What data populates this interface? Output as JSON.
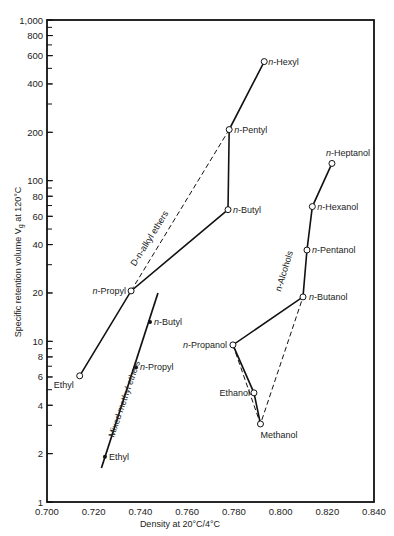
{
  "chart_data": {
    "type": "line",
    "title": "",
    "xlabel": "Density at 20°C/4°C",
    "ylabel": "Specific retention volume Vg at 120°C",
    "xlim": [
      0.7,
      0.84
    ],
    "ylim": [
      1,
      1000
    ],
    "yscale": "log",
    "grid": false,
    "x_ticks": [
      "0.700",
      "0.720",
      "0.740",
      "0.760",
      "0.780",
      "0.800",
      "0.820",
      "0.840"
    ],
    "y_ticks": [
      {
        "v": 1,
        "label": "1"
      },
      {
        "v": 2,
        "label": "2"
      },
      {
        "v": 4,
        "label": "4"
      },
      {
        "v": 6,
        "label": "6"
      },
      {
        "v": 8,
        "label": "8"
      },
      {
        "v": 10,
        "label": "10"
      },
      {
        "v": 20,
        "label": "20"
      },
      {
        "v": 40,
        "label": "40"
      },
      {
        "v": 60,
        "label": "60"
      },
      {
        "v": 80,
        "label": "80"
      },
      {
        "v": 100,
        "label": "100"
      },
      {
        "v": 200,
        "label": "200"
      },
      {
        "v": 400,
        "label": "400"
      },
      {
        "v": 600,
        "label": "600"
      },
      {
        "v": 800,
        "label": "800"
      },
      {
        "v": 1000,
        "label": "1,000"
      }
    ],
    "series": [
      {
        "name": "D-n-alkyl ethers",
        "marker": "open-circle",
        "points": [
          {
            "label": "Ethyl",
            "x": 0.714,
            "y": 6.1
          },
          {
            "label": "n-Propyl",
            "x": 0.736,
            "y": 20.6
          },
          {
            "label": "n-Butyl",
            "x": 0.7775,
            "y": 66
          },
          {
            "label": "n-Pentyl",
            "x": 0.778,
            "y": 208
          },
          {
            "label": "n-Hexyl",
            "x": 0.793,
            "y": 551
          }
        ],
        "dashed_link": [
          "n-Propyl",
          "n-Pentyl"
        ]
      },
      {
        "name": "n-Alcohols",
        "marker": "open-circle",
        "points": [
          {
            "label": "Methanol",
            "x": 0.7914,
            "y": 3.06
          },
          {
            "label": "Ethanol",
            "x": 0.7886,
            "y": 4.78
          },
          {
            "label": "n-Propanol",
            "x": 0.7796,
            "y": 9.5
          },
          {
            "label": "n-Butanol",
            "x": 0.8096,
            "y": 18.9
          },
          {
            "label": "n-Pentanol",
            "x": 0.8113,
            "y": 37
          },
          {
            "label": "n-Hexanol",
            "x": 0.8136,
            "y": 69
          },
          {
            "label": "n-Heptanol",
            "x": 0.822,
            "y": 128
          }
        ],
        "dashed_link": [
          "n-Propanol",
          "Methanol",
          "n-Butanol"
        ]
      },
      {
        "name": "Mixed methyl ethers",
        "marker": "filled-dot",
        "points": [
          {
            "label": "Ethyl",
            "x": 0.7248,
            "y": 1.91
          },
          {
            "label": "n-Propyl",
            "x": 0.7381,
            "y": 6.9
          },
          {
            "label": "n-Butyl",
            "x": 0.7441,
            "y": 13.2
          }
        ],
        "line_extent": {
          "x0": 0.7233,
          "y0": 1.63,
          "x1": 0.7475,
          "y1": 20
        }
      }
    ]
  }
}
